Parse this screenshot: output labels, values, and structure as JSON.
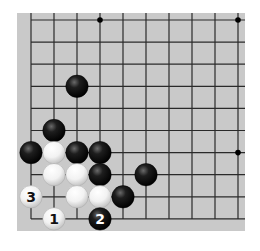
{
  "board": {
    "background_color": "#c9c9c9",
    "line_color": "#2a2a2a",
    "origin_x": 31,
    "origin_y": 20,
    "spacing_x": 23,
    "spacing_y": 22.1,
    "cols": 10,
    "rows": 10,
    "board_rect": {
      "x": 17,
      "y": 13,
      "width": 228,
      "height": 218
    },
    "open_edges": [
      "top",
      "right"
    ],
    "stone_radius": 11.2
  },
  "star_points": [
    {
      "col": 3,
      "row": 0
    },
    {
      "col": 9,
      "row": 0
    },
    {
      "col": 9,
      "row": 6
    }
  ],
  "stones": [
    {
      "color": "black",
      "col": 2,
      "row": 3,
      "label": ""
    },
    {
      "color": "black",
      "col": 1,
      "row": 5,
      "label": ""
    },
    {
      "color": "black",
      "col": 0,
      "row": 6,
      "label": ""
    },
    {
      "color": "white",
      "col": 1,
      "row": 6,
      "label": ""
    },
    {
      "color": "black",
      "col": 2,
      "row": 6,
      "label": ""
    },
    {
      "color": "black",
      "col": 3,
      "row": 6,
      "label": ""
    },
    {
      "color": "white",
      "col": 1,
      "row": 7,
      "label": ""
    },
    {
      "color": "white",
      "col": 2,
      "row": 7,
      "label": ""
    },
    {
      "color": "black",
      "col": 3,
      "row": 7,
      "label": ""
    },
    {
      "color": "black",
      "col": 5,
      "row": 7,
      "label": ""
    },
    {
      "color": "white",
      "col": 0,
      "row": 8,
      "label": "3"
    },
    {
      "color": "white",
      "col": 2,
      "row": 8,
      "label": ""
    },
    {
      "color": "white",
      "col": 3,
      "row": 8,
      "label": ""
    },
    {
      "color": "black",
      "col": 4,
      "row": 8,
      "label": ""
    },
    {
      "color": "white",
      "col": 1,
      "row": 9,
      "label": "1"
    },
    {
      "color": "black",
      "col": 3,
      "row": 9,
      "label": "2"
    }
  ],
  "move_labels": [
    "1",
    "2",
    "3"
  ]
}
